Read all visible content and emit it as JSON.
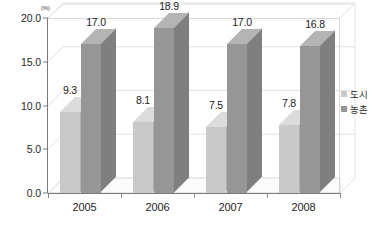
{
  "chart_data": {
    "type": "bar",
    "title": "",
    "subtitle": "",
    "xlabel": "",
    "ylabel": "",
    "unit_label": "(%)",
    "categories": [
      "2005",
      "2006",
      "2007",
      "2008"
    ],
    "series": [
      {
        "name": "도시",
        "values": [
          9.3,
          8.1,
          7.5,
          7.8
        ],
        "color": "#c9c9c9"
      },
      {
        "name": "농촌",
        "values": [
          17.0,
          18.9,
          17.0,
          16.8
        ],
        "color": "#969696"
      }
    ],
    "data_labels": [
      [
        "9.3",
        "17.0"
      ],
      [
        "8.1",
        "18.9"
      ],
      [
        "7.5",
        "17.0"
      ],
      [
        "7.8",
        "16.8"
      ]
    ],
    "ylim": [
      0.0,
      20.0
    ],
    "ytick_values": [
      0.0,
      5.0,
      10.0,
      15.0,
      20.0
    ],
    "ytick_labels": [
      "0.0",
      "5.0",
      "10.0",
      "15.0",
      "20.0"
    ],
    "grid": true,
    "grid_axis": "y",
    "legend_position": "right",
    "three_d": true
  },
  "legend": {
    "items": [
      {
        "label": "도시",
        "color": "#c9c9c9"
      },
      {
        "label": "농촌",
        "color": "#969696"
      }
    ]
  },
  "colors": {
    "series_light_front": "#c9c9c9",
    "series_light_side": "#b0b0b0",
    "series_light_top": "#dcdcdc",
    "series_dark_front": "#969696",
    "series_dark_side": "#7f7f7f",
    "series_dark_top": "#b4b4b4",
    "axis": "#7a7a7a",
    "grid": "#e2e2e2",
    "floor": "#fbfbfb",
    "text": "#222222",
    "background": "#ffffff"
  }
}
